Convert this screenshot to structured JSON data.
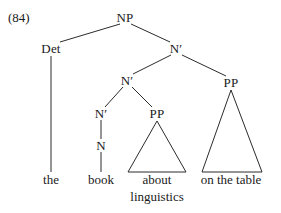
{
  "figure": {
    "example_number": "(84)",
    "domain_kind": "syntax-tree",
    "background_color": "#ffffff",
    "line_color": "#2b2b2b",
    "text_color": "#1a1a1a"
  },
  "nodes": [
    {
      "id": "np",
      "label": "NP",
      "x": 125,
      "y": 17
    },
    {
      "id": "det",
      "label": "Det",
      "x": 51,
      "y": 48
    },
    {
      "id": "nbar1",
      "label": "N′",
      "x": 176,
      "y": 48
    },
    {
      "id": "nbar2",
      "label": "N′",
      "x": 127,
      "y": 80
    },
    {
      "id": "pp2",
      "label": "PP",
      "x": 231,
      "y": 82
    },
    {
      "id": "nbar3",
      "label": "N′",
      "x": 101,
      "y": 113
    },
    {
      "id": "pp1",
      "label": "PP",
      "x": 157,
      "y": 113
    },
    {
      "id": "n",
      "label": "N",
      "x": 101,
      "y": 145
    }
  ],
  "terminals": [
    {
      "id": "the",
      "label": "the",
      "x": 51,
      "y": 180
    },
    {
      "id": "book",
      "label": "book",
      "x": 101,
      "y": 180
    },
    {
      "id": "about",
      "label": "about",
      "x": 157,
      "y": 180
    },
    {
      "id": "linguistics",
      "label": "linguistics",
      "x": 157,
      "y": 197
    },
    {
      "id": "onthetable",
      "label": "on the table",
      "x": 231,
      "y": 180
    }
  ],
  "edges": [
    {
      "id": "np-det",
      "from": "NP",
      "to": "Det",
      "x1": 120,
      "y1": 24,
      "x2": 60,
      "y2": 42
    },
    {
      "id": "np-nbar1",
      "from": "NP",
      "to": "N′",
      "x1": 131,
      "y1": 24,
      "x2": 170,
      "y2": 42
    },
    {
      "id": "nbar1-nbar2",
      "from": "N′",
      "to": "N′",
      "x1": 171,
      "y1": 55,
      "x2": 133,
      "y2": 74
    },
    {
      "id": "nbar1-pp2",
      "from": "N′",
      "to": "PP",
      "x1": 182,
      "y1": 55,
      "x2": 226,
      "y2": 76
    },
    {
      "id": "nbar2-nbar3",
      "from": "N′",
      "to": "N′",
      "x1": 123,
      "y1": 87,
      "x2": 105,
      "y2": 107
    },
    {
      "id": "nbar2-pp1",
      "from": "N′",
      "to": "PP",
      "x1": 132,
      "y1": 87,
      "x2": 152,
      "y2": 107
    },
    {
      "id": "nbar3-n",
      "from": "N′",
      "to": "N",
      "x1": 101,
      "y1": 120,
      "x2": 101,
      "y2": 139
    },
    {
      "id": "det-the",
      "from": "Det",
      "to": "the",
      "x1": 51,
      "y1": 56,
      "x2": 51,
      "y2": 172
    },
    {
      "id": "n-book",
      "from": "N",
      "to": "book",
      "x1": 101,
      "y1": 152,
      "x2": 101,
      "y2": 172
    }
  ],
  "triangles": [
    {
      "id": "pp-about-linguistics",
      "for_node": "PP",
      "covers": "about linguistics",
      "apex_x": 157,
      "apex_y": 121,
      "left_x": 128,
      "right_x": 186,
      "base_y": 172
    },
    {
      "id": "pp-on-the-table",
      "for_node": "PP",
      "covers": "on the table",
      "apex_x": 231,
      "apex_y": 90,
      "left_x": 202,
      "right_x": 262,
      "base_y": 172
    }
  ],
  "sentence": {
    "full_phrase": "the book about linguistics on the table"
  }
}
